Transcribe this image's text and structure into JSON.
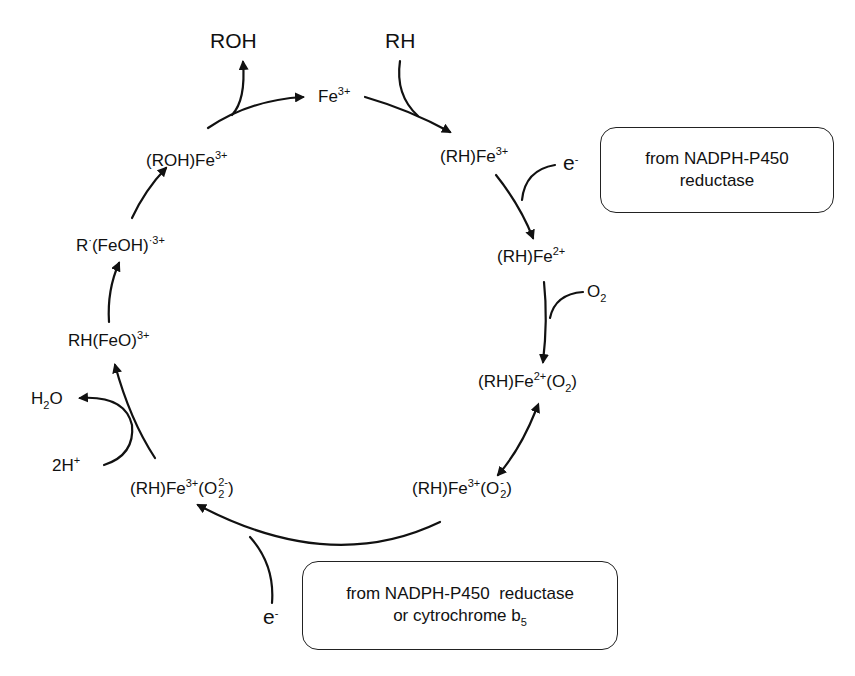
{
  "diagram": {
    "species": {
      "fe3": {
        "base": "Fe",
        "sup": "3+"
      },
      "rh_fe3": {
        "base": "(RH)Fe",
        "sup": "3+"
      },
      "rh_fe2": {
        "base": "(RH)Fe",
        "sup": "2+"
      },
      "rh_fe2_o2": {
        "pre": "(RH)Fe",
        "sup": "2+",
        "mid": "(O",
        "sub": "2",
        "post": ")"
      },
      "rh_fe3_o2minus": {
        "pre": "(RH)Fe",
        "sup": "3+",
        "mid": "(O",
        "o_sup": "-",
        "o_sub": "2",
        "post": ")"
      },
      "rh_fe3_o2_2minus": {
        "pre": "(RH)Fe",
        "sup": "3+",
        "mid": "(O",
        "o_sup": "2-",
        "o_sub": "2",
        "post": ")"
      },
      "rh_feo": {
        "base": "RH(FeO)",
        "sup": "3+"
      },
      "r_feoh": {
        "r": "R",
        "dot1": "·",
        "mid": "(FeOH)",
        "dot2": "·",
        "sup": "3+"
      },
      "roh_fe3": {
        "base": "(ROH)Fe",
        "sup": "3+"
      }
    },
    "reagents": {
      "roh": "ROH",
      "rh": "RH",
      "e1": {
        "base": "e",
        "sup": "-"
      },
      "o2": {
        "base": "O",
        "sub": "2"
      },
      "e2": {
        "base": "e",
        "sup": "-"
      },
      "h2o": {
        "pre": "H",
        "sub": "2",
        "post": "O"
      },
      "h2plus": {
        "base": "2H",
        "sup": "+"
      }
    },
    "boxes": {
      "box1": {
        "line1": "from NADPH-P450",
        "line2": "reductase"
      },
      "box2": {
        "line1": "from NADPH-P450  reductase",
        "line2_pre": "or cytrochrome b",
        "line2_sub": "5"
      }
    },
    "colors": {
      "line": "#111111",
      "background": "#ffffff"
    }
  }
}
